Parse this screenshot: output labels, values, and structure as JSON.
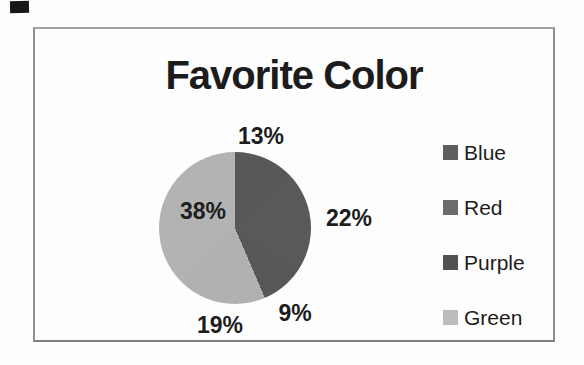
{
  "chart": {
    "title": "Favorite Color",
    "border_color": "#8f8f8f",
    "background": "#fdfdfd"
  },
  "chart_data": {
    "type": "pie",
    "title": "Favorite Color",
    "direction": "clockwise",
    "start_angle_deg": 0,
    "values_pct": [
      13,
      22,
      9,
      19,
      38
    ],
    "slice_labels_shown": [
      "13%",
      "22%",
      "9%",
      "19%",
      "38%"
    ],
    "slice_colors": [
      "#58585a",
      "#59595a",
      "#575758",
      "#b1b1b1",
      "#b3b3b3"
    ],
    "legend_entries": [
      "Blue",
      "Red",
      "Purple",
      "Green"
    ],
    "legend_position": "right",
    "label_position": "outside, 38% inside slice"
  },
  "legend": {
    "items": [
      {
        "label": "Blue",
        "swatch_color": "#5e5e5e"
      },
      {
        "label": "Red",
        "swatch_color": "#6c6c6c"
      },
      {
        "label": "Purple",
        "swatch_color": "#515151"
      },
      {
        "label": "Green",
        "swatch_color": "#bcbcbc"
      }
    ]
  }
}
